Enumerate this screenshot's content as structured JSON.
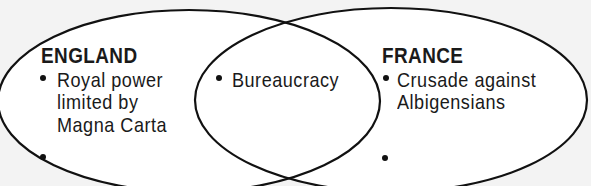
{
  "diagram": {
    "type": "venn",
    "sets": [
      {
        "id": "england",
        "title": "ENGLAND",
        "items": [
          [
            "Royal power",
            "limited by",
            "Magna Carta"
          ],
          []
        ]
      },
      {
        "id": "france",
        "title": "FRANCE",
        "items": [
          [
            "Crusade against",
            "Albigensians"
          ],
          []
        ]
      }
    ],
    "overlap": {
      "items": [
        [
          "Bureaucracy"
        ]
      ]
    },
    "colors": {
      "outline": "#111111",
      "fill": "#ffffff",
      "background": "#f3f3f3",
      "text": "#1a1a1a"
    }
  },
  "england": {
    "title": "ENGLAND",
    "item1_line1": "Royal power",
    "item1_line2": "limited by",
    "item1_line3": "Magna Carta"
  },
  "overlap": {
    "item1": "Bureaucracy"
  },
  "france": {
    "title": "FRANCE",
    "item1_line1": "Crusade against",
    "item1_line2": "Albigensians"
  }
}
